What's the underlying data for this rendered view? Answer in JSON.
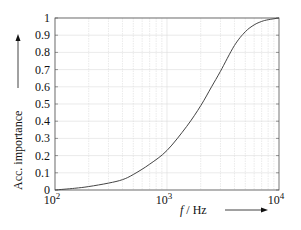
{
  "chart_data": {
    "type": "line",
    "title": "",
    "xlabel": "f / Hz",
    "ylabel": "Acc. importance",
    "xscale": "log",
    "xlim": [
      100,
      10000
    ],
    "ylim": [
      0,
      1
    ],
    "grid": true,
    "legend": null,
    "x_ticks": [
      "10^2",
      "10^3",
      "10^4"
    ],
    "y_ticks": [
      "0",
      "0.1",
      "0.2",
      "0.3",
      "0.4",
      "0.5",
      "0.6",
      "0.7",
      "0.8",
      "0.9",
      "1"
    ],
    "series": [
      {
        "name": "Acc. importance",
        "x": [
          100,
          150,
          200,
          300,
          400,
          500,
          700,
          1000,
          1500,
          2000,
          2500,
          3000,
          4000,
          5000,
          6000,
          7000,
          8000,
          10000
        ],
        "y": [
          0.0,
          0.01,
          0.02,
          0.04,
          0.06,
          0.09,
          0.15,
          0.23,
          0.37,
          0.49,
          0.6,
          0.69,
          0.84,
          0.92,
          0.96,
          0.98,
          0.99,
          1.0
        ]
      }
    ]
  },
  "labels": {
    "xlabel_f": "f",
    "xlabel_unit": " / Hz",
    "ylabel": "Acc. importance",
    "x_tick_base": "10",
    "x_tick_exps": [
      "2",
      "3",
      "4"
    ]
  }
}
